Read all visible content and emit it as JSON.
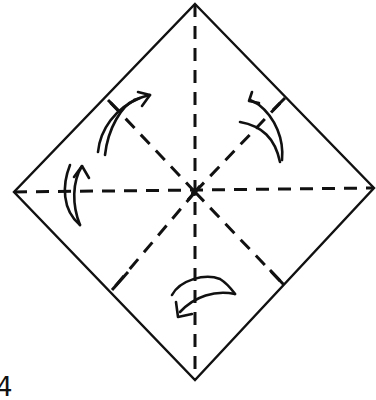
{
  "diagram": {
    "type": "origami-fold-instruction",
    "shape": "diamond (square rotated 45°)",
    "colors": {
      "line": "#111111",
      "background": "#ffffff"
    },
    "vertices": {
      "top": [
        195,
        4
      ],
      "right": [
        374,
        188
      ],
      "bottom": [
        195,
        380
      ],
      "left": [
        14,
        192
      ]
    },
    "center": [
      195,
      192
    ],
    "fold_lines": [
      {
        "name": "vertical-crease",
        "style": "dashed",
        "from": "top",
        "to": "bottom"
      },
      {
        "name": "horizontal-crease",
        "style": "dashed",
        "from": "left",
        "to": "right"
      },
      {
        "name": "diagonal-upper-left",
        "style": "dashed",
        "to": "upper-left edge midpoint"
      },
      {
        "name": "diagonal-upper-right",
        "style": "dashed",
        "to": "upper-right edge midpoint"
      },
      {
        "name": "diagonal-lower-left",
        "style": "dashed",
        "to": "lower-left edge midpoint"
      },
      {
        "name": "diagonal-lower-right",
        "style": "dashed",
        "to": "lower-right edge midpoint"
      }
    ],
    "arrows": [
      {
        "name": "upper-left-fold-arrow",
        "direction": "curved toward upper-right"
      },
      {
        "name": "upper-right-fold-arrow",
        "direction": "curved toward upper-left"
      },
      {
        "name": "left-fold-arrow",
        "direction": "curved upward"
      },
      {
        "name": "bottom-fold-arrow",
        "direction": "curved toward lower-left"
      }
    ],
    "step_label": "4"
  }
}
